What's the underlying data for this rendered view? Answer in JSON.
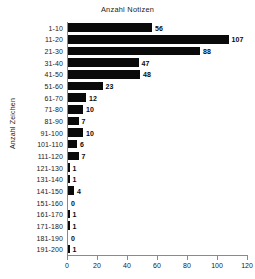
{
  "chart_data": {
    "type": "bar",
    "orientation": "horizontal",
    "title": "Anzahl Notizen",
    "xlabel": "",
    "ylabel": "Anzahl Zeichen",
    "categories": [
      "1-10",
      "11-20",
      "21-30",
      "31-40",
      "41-50",
      "51-60",
      "61-70",
      "71-80",
      "81-90",
      "91-100",
      "101-110",
      "111-120",
      "121-130",
      "131-140",
      "141-150",
      "151-160",
      "161-170",
      "171-180",
      "181-190",
      "191-200"
    ],
    "values": [
      56,
      107,
      88,
      47,
      48,
      23,
      12,
      10,
      7,
      10,
      6,
      7,
      1,
      1,
      4,
      0,
      1,
      1,
      0,
      1
    ],
    "value_labels": [
      "56",
      "107",
      "88",
      "47",
      "48",
      "23",
      "12",
      "10",
      "7",
      "10",
      "6",
      "7",
      "1",
      "1",
      "4",
      "0",
      "1",
      "1",
      "0",
      "1"
    ],
    "xlim": [
      0,
      120
    ],
    "xticks": [
      0,
      20,
      40,
      60,
      80,
      100,
      120
    ],
    "xtick_labels": [
      "0",
      "20",
      "40",
      "60",
      "80",
      "100",
      "120"
    ],
    "grid": false,
    "legend": false,
    "bar_color": "#0a0a0a",
    "axis_color": "#8a8a8a",
    "text_color": "#1a1a1a",
    "background": "#ffffff"
  }
}
